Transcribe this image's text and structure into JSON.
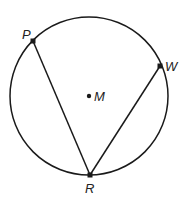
{
  "diagram": {
    "type": "circle-geometry",
    "circle": {
      "center_label": "M",
      "cx": 89,
      "cy": 96,
      "r": 79
    },
    "points": [
      {
        "label": "P",
        "x": 33,
        "y": 41,
        "label_x": 22,
        "label_y": 39
      },
      {
        "label": "W",
        "x": 160,
        "y": 66,
        "label_x": 165,
        "label_y": 71
      },
      {
        "label": "R",
        "x": 90,
        "y": 175,
        "label_x": 85,
        "label_y": 193
      },
      {
        "label": "M",
        "x": 89,
        "y": 96,
        "label_x": 94,
        "label_y": 101
      }
    ],
    "segments": [
      {
        "from": "P",
        "to": "R"
      },
      {
        "from": "R",
        "to": "W"
      }
    ],
    "colors": {
      "stroke": "#1a1a1a",
      "background": "#ffffff"
    }
  }
}
